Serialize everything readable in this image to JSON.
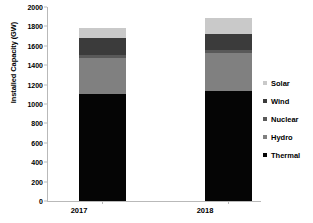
{
  "chart_data": {
    "type": "bar",
    "subtype": "stacked-bar",
    "title": "",
    "xlabel": "",
    "ylabel": "Installed Capacity (GW)",
    "categories": [
      "2017",
      "2018"
    ],
    "ylim": [
      0,
      2000
    ],
    "yticks": [
      0,
      200,
      400,
      600,
      800,
      1000,
      1200,
      1400,
      1600,
      1800,
      2000
    ],
    "ytick_labels": [
      "0",
      "200",
      "400",
      "600",
      "800",
      "1000",
      "1200",
      "1400",
      "1600",
      "1800",
      "2000"
    ],
    "grid": false,
    "legend_position": "right",
    "stack_order_bottom_to_top": [
      "Thermal",
      "Hydro",
      "Nuclear",
      "Wind",
      "Solar"
    ],
    "series": [
      {
        "name": "Solar",
        "color": "#c9c9c9",
        "values": [
          100,
          165
        ]
      },
      {
        "name": "Wind",
        "color": "#3b3b3b",
        "values": [
          170,
          160
        ]
      },
      {
        "name": "Nuclear",
        "color": "#595959",
        "values": [
          35,
          35
        ]
      },
      {
        "name": "Hydro",
        "color": "#808080",
        "values": [
          375,
          390
        ]
      },
      {
        "name": "Thermal",
        "color": "#050505",
        "values": [
          1100,
          1135
        ]
      }
    ],
    "totals": [
      1780,
      1885
    ]
  },
  "legend": {
    "items": [
      {
        "label": "Solar",
        "color": "#c9c9c9"
      },
      {
        "label": "Wind",
        "color": "#3b3b3b"
      },
      {
        "label": "Nuclear",
        "color": "#595959"
      },
      {
        "label": "Hydro",
        "color": "#808080"
      },
      {
        "label": "Thermal",
        "color": "#050505"
      }
    ]
  }
}
